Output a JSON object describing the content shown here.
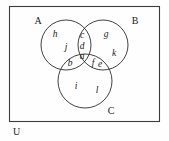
{
  "diagram": {
    "type": "venn-diagram-three-sets",
    "universe": {
      "label": "U"
    },
    "sets": [
      {
        "id": "A",
        "label": "A"
      },
      {
        "id": "B",
        "label": "B"
      },
      {
        "id": "C",
        "label": "C"
      }
    ],
    "regions": [
      {
        "id": "a",
        "label": "a",
        "meaning": "A and B and C"
      },
      {
        "id": "b",
        "label": "b",
        "meaning": "A and C only"
      },
      {
        "id": "c",
        "label": "c",
        "meaning": "A and B only (upper)"
      },
      {
        "id": "d",
        "label": "d",
        "meaning": "A and B only (lower)"
      },
      {
        "id": "e",
        "label": "e",
        "meaning": "B and C only (outer)"
      },
      {
        "id": "f",
        "label": "f",
        "meaning": "B and C only (inner)"
      },
      {
        "id": "g",
        "label": "g",
        "meaning": "B only (upper)"
      },
      {
        "id": "h",
        "label": "h",
        "meaning": "A only (upper)"
      },
      {
        "id": "i",
        "label": "i",
        "meaning": "C only (left)"
      },
      {
        "id": "j",
        "label": "j",
        "meaning": "A only (lower)"
      },
      {
        "id": "k",
        "label": "k",
        "meaning": "B only (lower)"
      },
      {
        "id": "l",
        "label": "l",
        "meaning": "C only (right)"
      }
    ],
    "colors": {
      "stroke": "#2e2e2e",
      "frame": "#3c3c3c",
      "background": "#fefefe",
      "text": "#1a1a1a"
    }
  }
}
